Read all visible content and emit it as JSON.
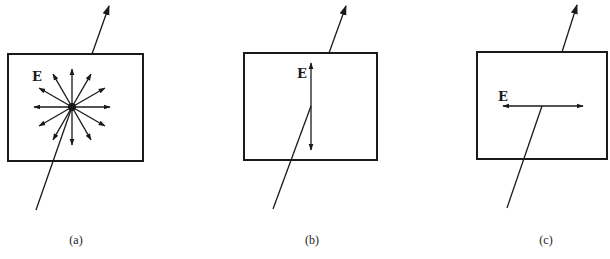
{
  "diagram": {
    "colors": {
      "ink": "#1a1a1a",
      "background": "#ffffff"
    },
    "panels": [
      {
        "id": "a",
        "caption": "(a)",
        "field_label": "E",
        "state": "unpolarized",
        "box": {
          "x1": 8,
          "y1": 54,
          "x2": 143,
          "y2": 161
        },
        "center": [
          72,
          107
        ],
        "ray_in": {
          "from": [
            36,
            210
          ],
          "to": [
            72,
            107
          ]
        },
        "ray_out": {
          "from": [
            92,
            54
          ],
          "to": [
            109,
            6
          ]
        },
        "e_vectors_deg": [
          0,
          30,
          60,
          90,
          120,
          150,
          180,
          210,
          240,
          270,
          300,
          330
        ],
        "e_vector_length": 38,
        "label_pos": [
          32,
          81
        ],
        "caption_pos": [
          76,
          244
        ]
      },
      {
        "id": "b",
        "caption": "(b)",
        "field_label": "E",
        "state": "vertically polarized",
        "box": {
          "x1": 244,
          "y1": 53,
          "x2": 377,
          "y2": 160
        },
        "center": [
          311,
          106
        ],
        "ray_in": {
          "from": [
            273,
            209
          ],
          "to": [
            311,
            106
          ]
        },
        "ray_out": {
          "from": [
            329,
            53
          ],
          "to": [
            346,
            6
          ]
        },
        "e_vector": {
          "from": [
            311,
            63
          ],
          "to": [
            311,
            150
          ]
        },
        "label_pos": [
          297,
          78
        ],
        "caption_pos": [
          312,
          244
        ]
      },
      {
        "id": "c",
        "caption": "(c)",
        "field_label": "E",
        "state": "horizontally polarized",
        "box": {
          "x1": 477,
          "y1": 52,
          "x2": 607,
          "y2": 159
        },
        "center": [
          542,
          106
        ],
        "ray_in": {
          "from": [
            507,
            208
          ],
          "to": [
            542,
            106
          ]
        },
        "ray_out": {
          "from": [
            562,
            52
          ],
          "to": [
            577,
            5
          ]
        },
        "e_vector": {
          "from": [
            503,
            106
          ],
          "to": [
            583,
            106
          ]
        },
        "label_pos": [
          498,
          101
        ],
        "caption_pos": [
          546,
          244
        ]
      }
    ]
  }
}
